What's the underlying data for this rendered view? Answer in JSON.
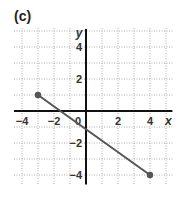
{
  "panel": {
    "label": "(c)"
  },
  "chart_data": {
    "type": "line",
    "title": "(c)",
    "xlabel": "x",
    "ylabel": "y",
    "xlim": [
      -4.5,
      5.4
    ],
    "ylim": [
      -4.6,
      5
    ],
    "grid": true,
    "grid_style": "dotted",
    "x_ticks": [
      -4,
      -2,
      0,
      2,
      4
    ],
    "x_tick_labels": [
      "-4",
      "-2",
      "0",
      "2",
      "4"
    ],
    "y_ticks": [
      -4,
      -2,
      2,
      4
    ],
    "y_tick_labels": [
      "-4",
      "-2",
      "2",
      "4"
    ],
    "series": [
      {
        "name": "segment",
        "x": [
          -3,
          4
        ],
        "y": [
          1,
          -4
        ],
        "color": "#555555",
        "endpoints": "filled-dots"
      }
    ]
  },
  "colors": {
    "axis": "#111111",
    "grid": "#9a9a9a",
    "line": "#555555"
  }
}
